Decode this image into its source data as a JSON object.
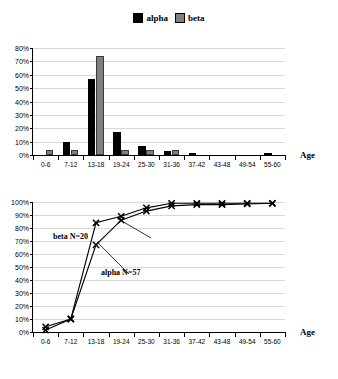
{
  "legend": {
    "items": [
      {
        "label": "alpha",
        "color": "#000000",
        "icon": "square-swatch"
      },
      {
        "label": "beta",
        "color": "#808080",
        "icon": "square-swatch"
      }
    ]
  },
  "axis": {
    "x_title": "Age"
  },
  "chart_data": [
    {
      "type": "bar",
      "title": "",
      "xlabel": "Age",
      "ylabel": "",
      "ylim": [
        0,
        80
      ],
      "grid": true,
      "legend_position": "top-center",
      "categories": [
        "0-6",
        "7-12",
        "13-18",
        "19-24",
        "25-30",
        "31-36",
        "37-42",
        "43-48",
        "49-54",
        "55-60"
      ],
      "ytick_labels": [
        "0%",
        "10%",
        "20%",
        "30%",
        "40%",
        "50%",
        "60%",
        "70%",
        "80%"
      ],
      "ytick_values": [
        0,
        10,
        20,
        30,
        40,
        50,
        60,
        70,
        80
      ],
      "series": [
        {
          "name": "alpha",
          "color": "#000000",
          "values": [
            0,
            10,
            57,
            17,
            6.5,
            3,
            1.5,
            0,
            0,
            1.5
          ]
        },
        {
          "name": "beta",
          "color": "#808080",
          "values": [
            4,
            4,
            74,
            4,
            4,
            3.5,
            0,
            0,
            0,
            0
          ]
        }
      ]
    },
    {
      "type": "line",
      "title": "",
      "xlabel": "Age",
      "ylabel": "",
      "ylim": [
        0,
        100
      ],
      "grid": true,
      "marker": "x",
      "categories": [
        "0-6",
        "7-12",
        "13-18",
        "19-24",
        "25-30",
        "31-36",
        "37-42",
        "43-48",
        "49-54",
        "55-60"
      ],
      "ytick_labels": [
        "0%",
        "10%",
        "20%",
        "30%",
        "40%",
        "50%",
        "60%",
        "70%",
        "80%",
        "90%",
        "100%"
      ],
      "ytick_values": [
        0,
        10,
        20,
        30,
        40,
        50,
        60,
        70,
        80,
        90,
        100
      ],
      "series": [
        {
          "name": "beta",
          "color": "#000000",
          "values": [
            4,
            10,
            84,
            89,
            95.5,
            99,
            99,
            99,
            99,
            99
          ]
        },
        {
          "name": "alpha",
          "color": "#000000",
          "values": [
            1.5,
            10,
            67,
            86,
            93,
            97,
            98,
            98,
            98.5,
            99
          ]
        }
      ],
      "annotations": [
        {
          "text": "beta  N=20",
          "series": "beta"
        },
        {
          "text": "alpha N=57",
          "series": "alpha"
        }
      ]
    }
  ]
}
